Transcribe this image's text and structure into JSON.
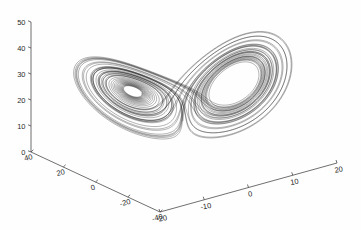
{
  "figure": {
    "title": "",
    "background_color": "#fefefe",
    "axis_color": "#4a4a4a",
    "curve_color": "#000000"
  },
  "chart_data": {
    "type": "line",
    "title": "",
    "subtitle": "",
    "projection": "3d",
    "xlabel": "",
    "ylabel": "",
    "zlabel": "",
    "grid": false,
    "legend": [],
    "legend_position": "none",
    "axes": {
      "x": {
        "ticks": [
          -20,
          -10,
          0,
          10,
          20
        ],
        "tick_labels": [
          "-20",
          "-10",
          "0",
          "10",
          "20"
        ],
        "range": [
          -20,
          20
        ]
      },
      "y": {
        "ticks": [
          40,
          20,
          0,
          -20,
          -40
        ],
        "tick_labels": [
          "40",
          "20",
          "0",
          "-20",
          "-40"
        ],
        "range": [
          -40,
          40
        ]
      },
      "z": {
        "ticks": [
          0,
          10,
          20,
          30,
          40,
          50
        ],
        "tick_labels": [
          "0",
          "10",
          "20",
          "30",
          "40",
          "50"
        ],
        "range": [
          0,
          50
        ]
      }
    },
    "system": {
      "name": "Lorenz",
      "sigma": 10,
      "rho": 28,
      "beta": 2.6666666667,
      "x0": 1.0,
      "y0": 1.0,
      "z0": 1.0,
      "dt": 0.0045,
      "steps": 11000
    },
    "view": {
      "origin_px": [
        31,
        152
      ],
      "x_axis_end_px": [
        337,
        163
      ],
      "y_axis_end_px": [
        160,
        212
      ],
      "z_axis_top_px": [
        31,
        22
      ]
    }
  }
}
